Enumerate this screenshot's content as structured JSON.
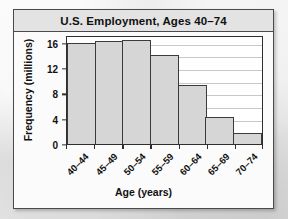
{
  "figure": {
    "title": "U.S. Employment, Ages 40–74"
  },
  "chart_data": {
    "type": "bar",
    "title": "U.S. Employment, Ages 40–74",
    "subtitle": "",
    "xlabel": "Age (years)",
    "ylabel": "Frequency (millions)",
    "categories": [
      "40–44",
      "45–49",
      "50–54",
      "55–59",
      "60–64",
      "65–69",
      "70–74"
    ],
    "values": [
      16.0,
      16.3,
      16.4,
      14.0,
      9.3,
      4.2,
      1.8
    ],
    "ylim": [
      0,
      17.2
    ],
    "ytick_labels": [
      "0",
      "4",
      "8",
      "12",
      "16"
    ],
    "ytick_values": [
      0,
      4,
      8,
      12,
      16
    ],
    "gridline_values": [
      2,
      4,
      6,
      8,
      10,
      12,
      14,
      16
    ],
    "grid": true,
    "legend": false,
    "bar_fill": "#d6d6d6",
    "bar_edge": "#3b3b3b",
    "gridline_color": "#c9c9c9",
    "plot_background": "#ffffff",
    "figure_background": "#fbfbfb",
    "title_bar_background": "#e3e3e3",
    "frame_color": "#4a4a4a"
  }
}
